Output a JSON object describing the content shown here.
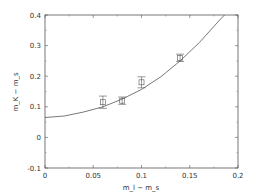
{
  "chart_data": {
    "type": "scatter",
    "title": "",
    "xlabel": "m_l − m_s",
    "ylabel": "m_K − m_s",
    "xlim": [
      0,
      0.2
    ],
    "ylim": [
      -0.1,
      0.4
    ],
    "xticks": [
      "0",
      "0.05",
      "0.1",
      "0.15",
      "0.2"
    ],
    "yticks": [
      "-0.1",
      "0",
      "0.1",
      "0.2",
      "0.3",
      "0.4"
    ],
    "grid": false,
    "legend": null,
    "series": [
      {
        "name": "data",
        "marker": "square",
        "x": [
          0.06,
          0.08,
          0.1,
          0.14
        ],
        "y": [
          0.115,
          0.12,
          0.18,
          0.26
        ],
        "yerr": [
          0.02,
          0.012,
          0.018,
          0.012
        ]
      },
      {
        "name": "fit",
        "style": "line",
        "x": [
          0,
          0.02,
          0.04,
          0.06,
          0.08,
          0.1,
          0.12,
          0.14,
          0.16,
          0.18,
          0.186
        ],
        "y": [
          0.065,
          0.07,
          0.083,
          0.1,
          0.125,
          0.157,
          0.198,
          0.25,
          0.31,
          0.38,
          0.4
        ]
      }
    ]
  }
}
